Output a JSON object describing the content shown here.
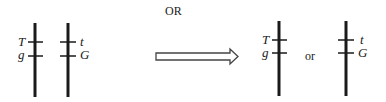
{
  "header": {
    "or_label": "OR"
  },
  "left_pair": {
    "chromosome_1": {
      "upper_allele": "T",
      "lower_allele": "g"
    },
    "chromosome_2": {
      "upper_allele": "t",
      "lower_allele": "G"
    }
  },
  "arrow": {
    "direction": "right"
  },
  "right_result": {
    "option_1": {
      "upper_allele": "T",
      "lower_allele": "g"
    },
    "separator": "or",
    "option_2": {
      "upper_allele": "t",
      "lower_allele": "G"
    }
  },
  "colors": {
    "line": "#1a1a1a",
    "arrow_stroke": "#444444"
  }
}
